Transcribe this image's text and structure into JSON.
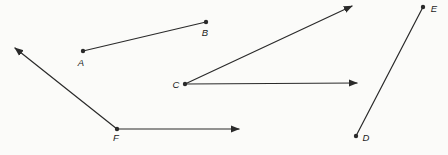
{
  "figure": {
    "width": 448,
    "height": 155,
    "background": "#fbfbf9",
    "stroke_color": "#2a2a2a",
    "label_color": "#1c1c1c",
    "stroke_width": 1.2,
    "dot_radius": 2.2,
    "points": [
      {
        "id": "A",
        "label": "A",
        "x": 83,
        "y": 51,
        "label_x": 81,
        "label_y": 66
      },
      {
        "id": "B",
        "label": "B",
        "x": 206,
        "y": 22,
        "label_x": 205,
        "label_y": 36
      },
      {
        "id": "C",
        "label": "C",
        "x": 185,
        "y": 84,
        "label_x": 176,
        "label_y": 88
      },
      {
        "id": "D",
        "label": "D",
        "x": 356,
        "y": 136,
        "label_x": 366,
        "label_y": 141
      },
      {
        "id": "E",
        "label": "E",
        "x": 423,
        "y": 7,
        "label_x": 434,
        "label_y": 12
      },
      {
        "id": "F",
        "label": "F",
        "x": 117,
        "y": 129,
        "label_x": 116,
        "label_y": 141
      }
    ],
    "elements": [
      {
        "name": "segment-AB",
        "type": "segment",
        "x1": 83,
        "y1": 51,
        "x2": 206,
        "y2": 22
      },
      {
        "name": "ray-C-diagonal",
        "type": "ray",
        "x1": 185,
        "y1": 84,
        "x2": 352,
        "y2": 6
      },
      {
        "name": "ray-C-horizontal",
        "type": "ray",
        "x1": 185,
        "y1": 84,
        "x2": 357,
        "y2": 83
      },
      {
        "name": "ray-F-diagonal",
        "type": "ray",
        "x1": 117,
        "y1": 129,
        "x2": 15,
        "y2": 48
      },
      {
        "name": "ray-F-horizontal",
        "type": "ray",
        "x1": 117,
        "y1": 129,
        "x2": 239,
        "y2": 129
      },
      {
        "name": "segment-DE",
        "type": "segment",
        "x1": 356,
        "y1": 136,
        "x2": 423,
        "y2": 7
      }
    ]
  }
}
